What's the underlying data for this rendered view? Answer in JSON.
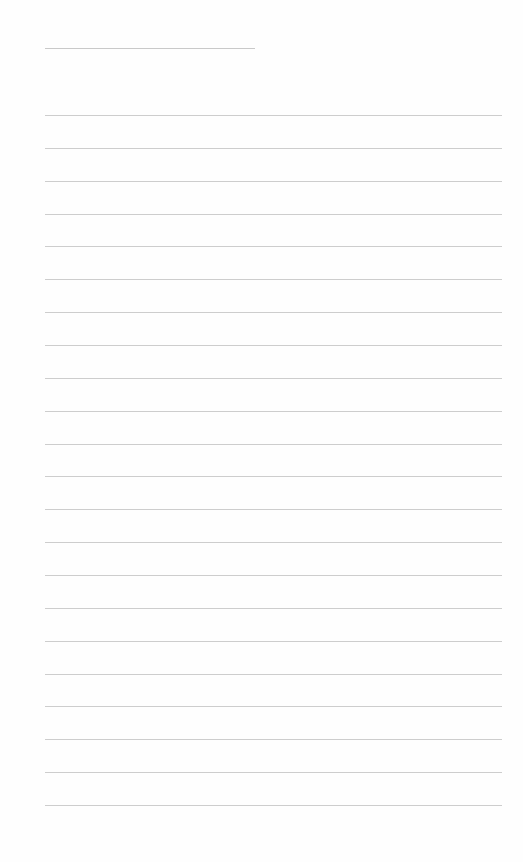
{
  "page": {
    "type": "lined-notebook-paper",
    "background_color": "#fefefe",
    "line_color": "#cdcdcd",
    "header_line": {
      "x": 45,
      "y": 48,
      "width": 210
    },
    "ruled_lines": {
      "count": 22,
      "x": 45,
      "width": 457,
      "first_y": 115,
      "spacing": 32.86
    },
    "bleed_through_text": ""
  }
}
